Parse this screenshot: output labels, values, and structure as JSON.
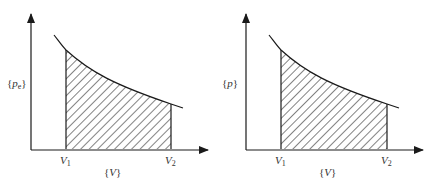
{
  "colors": {
    "ink": "#1a1a1a",
    "label": "#333333",
    "background": "#ffffff"
  },
  "diagrams": [
    {
      "id": "left",
      "y_axis_label": {
        "open": "{",
        "symbol": "p",
        "subscript": "e",
        "close": "}"
      },
      "x_axis_label": {
        "open": "{",
        "symbol": "V",
        "close": "}"
      },
      "v1_label": {
        "symbol": "V",
        "subscript": "1"
      },
      "v2_label": {
        "symbol": "V",
        "subscript": "2"
      },
      "shaded_region": "area under curve between V1 and V2 (hatched)"
    },
    {
      "id": "right",
      "y_axis_label": {
        "open": "{",
        "symbol": "p",
        "subscript": "",
        "close": "}"
      },
      "x_axis_label": {
        "open": "{",
        "symbol": "V",
        "close": "}"
      },
      "v1_label": {
        "symbol": "V",
        "subscript": "1"
      },
      "v2_label": {
        "symbol": "V",
        "subscript": "2"
      },
      "shaded_region": "area under curve between V1 and V2 (hatched)"
    }
  ]
}
